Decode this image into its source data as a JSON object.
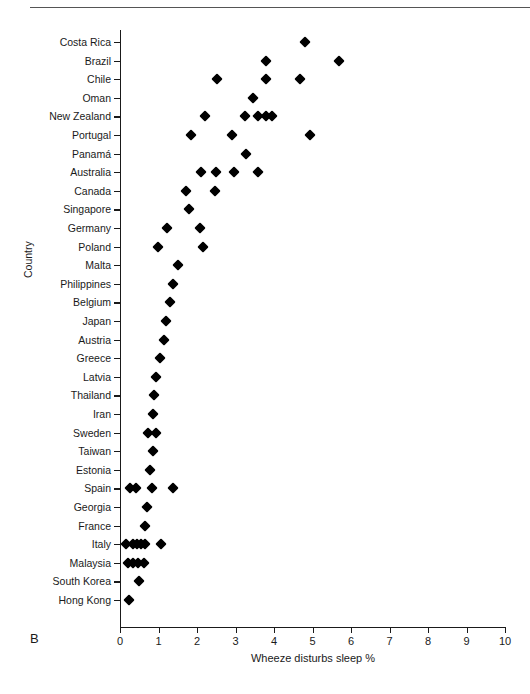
{
  "panel": {
    "label": "B"
  },
  "axes": {
    "x_title": "Wheeze disturbs sleep %",
    "y_title": "Country",
    "x_ticks": [
      "0",
      "1",
      "2",
      "3",
      "4",
      "5",
      "6",
      "7",
      "8",
      "9",
      "10"
    ]
  },
  "chart_data": {
    "type": "scatter",
    "title": "",
    "xlabel": "Wheeze disturbs sleep %",
    "ylabel": "Country",
    "xlim": [
      0,
      10
    ],
    "grid": false,
    "legend": null,
    "marker": "diamond",
    "marker_color": "#000000",
    "categories": [
      "Costa Rica",
      "Brazil",
      "Chile",
      "Oman",
      "New Zealand",
      "Portugal",
      "Panamá",
      "Australia",
      "Canada",
      "Singapore",
      "Germany",
      "Poland",
      "Malta",
      "Philippines",
      "Belgium",
      "Japan",
      "Austria",
      "Greece",
      "Latvia",
      "Thailand",
      "Iran",
      "Sweden",
      "Taiwan",
      "Estonia",
      "Spain",
      "Georgia",
      "France",
      "Italy",
      "Malaysia",
      "South Korea",
      "Hong Kong"
    ],
    "points": [
      {
        "country": "Costa Rica",
        "values": [
          4.8
        ]
      },
      {
        "country": "Brazil",
        "values": [
          3.78,
          5.7
        ]
      },
      {
        "country": "Chile",
        "values": [
          2.52,
          3.78,
          4.68
        ]
      },
      {
        "country": "Oman",
        "values": [
          3.45
        ]
      },
      {
        "country": "New Zealand",
        "values": [
          2.21,
          3.25,
          3.58,
          3.78,
          3.95
        ]
      },
      {
        "country": "Portugal",
        "values": [
          1.84,
          2.91,
          4.94
        ]
      },
      {
        "country": "Panamá",
        "values": [
          3.27
        ]
      },
      {
        "country": "Australia",
        "values": [
          2.1,
          2.49,
          2.96,
          3.58
        ]
      },
      {
        "country": "Canada",
        "values": [
          1.71,
          2.47
        ]
      },
      {
        "country": "Singapore",
        "values": [
          1.79
        ]
      },
      {
        "country": "Germany",
        "values": [
          1.22,
          2.08
        ]
      },
      {
        "country": "Poland",
        "values": [
          0.99,
          2.16
        ]
      },
      {
        "country": "Malta",
        "values": [
          1.51
        ]
      },
      {
        "country": "Philippines",
        "values": [
          1.38
        ]
      },
      {
        "country": "Belgium",
        "values": [
          1.3
        ]
      },
      {
        "country": "Japan",
        "values": [
          1.19
        ]
      },
      {
        "country": "Austria",
        "values": [
          1.14
        ]
      },
      {
        "country": "Greece",
        "values": [
          1.04
        ]
      },
      {
        "country": "Latvia",
        "values": [
          0.94
        ]
      },
      {
        "country": "Thailand",
        "values": [
          0.88
        ]
      },
      {
        "country": "Iran",
        "values": [
          0.86
        ]
      },
      {
        "country": "Sweden",
        "values": [
          0.73,
          0.93
        ]
      },
      {
        "country": "Taiwan",
        "values": [
          0.85
        ]
      },
      {
        "country": "Estonia",
        "values": [
          0.78
        ]
      },
      {
        "country": "Spain",
        "values": [
          0.26,
          0.42,
          0.83,
          1.38
        ]
      },
      {
        "country": "Georgia",
        "values": [
          0.7
        ]
      },
      {
        "country": "France",
        "values": [
          0.65
        ]
      },
      {
        "country": "Italy",
        "values": [
          0.16,
          0.34,
          0.45,
          0.55,
          0.64,
          1.06
        ]
      },
      {
        "country": "Malaysia",
        "values": [
          0.21,
          0.35,
          0.47,
          0.62
        ]
      },
      {
        "country": "South Korea",
        "values": [
          0.5
        ]
      },
      {
        "country": "Hong Kong",
        "values": [
          0.24
        ]
      }
    ]
  }
}
